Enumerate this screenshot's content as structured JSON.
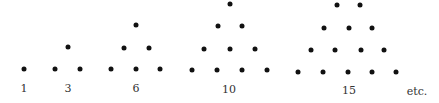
{
  "figure": {
    "groups": [
      {
        "label": "1",
        "label_pos": [
          24,
          88
        ],
        "dots": [
          [
            24,
            69
          ]
        ]
      },
      {
        "label": "3",
        "label_pos": [
          68,
          88
        ],
        "dots": [
          [
            68,
            47
          ],
          [
            55,
            69
          ],
          [
            80,
            69
          ]
        ]
      },
      {
        "label": "6",
        "label_pos": [
          136,
          88
        ],
        "dots": [
          [
            136,
            25
          ],
          [
            124,
            48
          ],
          [
            149,
            48
          ],
          [
            111,
            69
          ],
          [
            136,
            69
          ],
          [
            160,
            69
          ]
        ]
      },
      {
        "label": "10",
        "label_pos": [
          229,
          89
        ],
        "dots": [
          [
            230,
            4
          ],
          [
            218,
            26
          ],
          [
            242,
            26
          ],
          [
            204,
            49
          ],
          [
            230,
            49
          ],
          [
            255,
            49
          ],
          [
            192,
            70
          ],
          [
            217,
            70
          ],
          [
            242,
            70
          ],
          [
            267,
            70
          ]
        ]
      },
      {
        "label": "15",
        "label_pos": [
          349,
          90
        ],
        "dots": [
          [
            337,
            5
          ],
          [
            360,
            5
          ],
          [
            324,
            28
          ],
          [
            349,
            28
          ],
          [
            372,
            28
          ],
          [
            311,
            50
          ],
          [
            335,
            50
          ],
          [
            361,
            50
          ],
          [
            384,
            50
          ],
          [
            298,
            72
          ],
          [
            323,
            72
          ],
          [
            348,
            72
          ],
          [
            372,
            72
          ],
          [
            396,
            72
          ]
        ]
      }
    ],
    "trailing_text": "etc.",
    "trailing_pos": [
      417,
      91
    ],
    "dot_color": "#111111"
  }
}
